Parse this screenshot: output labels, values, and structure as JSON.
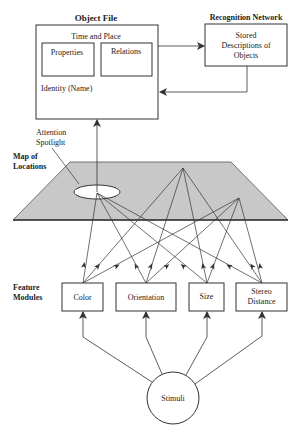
{
  "diagram": {
    "object_file": {
      "title": "Object File",
      "time_place": "Time and Place",
      "properties": "Properties",
      "relations": "Relations",
      "identity": "Identity (Name)"
    },
    "recognition_network": {
      "title": "Recognition Network",
      "line1": "Stored",
      "line2": "Descriptions of",
      "line3": "Objects"
    },
    "attention": {
      "line1": "Attention",
      "line2": "Spotlight"
    },
    "map": {
      "line1": "Map of",
      "line2": "Locations"
    },
    "feature_label": {
      "line1": "Feature",
      "line2": "Modules"
    },
    "modules": {
      "color": "Color",
      "orientation": "Orientation",
      "size": "Size",
      "stereo1": "Stereo",
      "stereo2": "Distance"
    },
    "stimuli": "Stimuli",
    "colors": {
      "ink": "#333333",
      "plane": "#c8c8c8",
      "background": "#ffffff"
    }
  }
}
